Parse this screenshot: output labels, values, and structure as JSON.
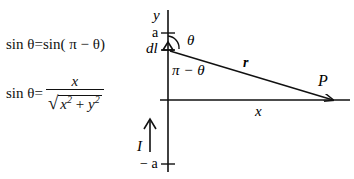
{
  "equations": {
    "eq1": {
      "lhs": "sin θ",
      "eq": "=",
      "rhs": "sin( π − θ)"
    },
    "eq2": {
      "lhs": "sin θ",
      "eq": "=",
      "numerator": "x",
      "denominator_x": "x",
      "denominator_y": "y",
      "exp": "2",
      "plus": "+"
    }
  },
  "diagram": {
    "y_axis_label": "y",
    "top_tick_label": "a",
    "bottom_tick_label": "− a",
    "element_label": "dl",
    "angle_label": "θ",
    "supp_angle_label": "π − θ",
    "vector_label": "r",
    "point_label": "P",
    "x_label": "x",
    "current_label": "I"
  }
}
